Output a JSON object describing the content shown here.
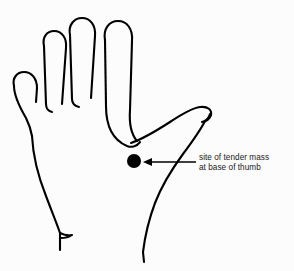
{
  "figure": {
    "type": "anatomical-line-drawing",
    "background_color": "#fcfcfc",
    "ink_color": "#000000"
  },
  "annotation": {
    "line1": "site of tender mass",
    "line2": "at base of thumb",
    "full_text": "site of tender mass at base of thumb",
    "text_color": "#1a1a1a",
    "leader": {
      "type": "arrow",
      "direction": "left",
      "from_x": 196,
      "from_y": 162,
      "to_x": 143,
      "to_y": 162,
      "color": "#000000"
    }
  },
  "marker": {
    "label": "tender-mass-marker",
    "shape": "filled-circle",
    "center_x": 134,
    "center_y": 161,
    "radius": 7,
    "color": "#000000"
  }
}
